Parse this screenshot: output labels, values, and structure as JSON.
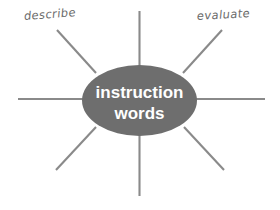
{
  "diagram": {
    "type": "spider-mind-map",
    "background_color": "#ffffff",
    "center": {
      "shape": "ellipse",
      "fill_color": "#6e6e6e",
      "text_color": "#ffffff",
      "line1": "instruction",
      "line2": "words"
    },
    "spoke_color": "#8a8a8a",
    "spoke_count": 8,
    "spokes": [
      {
        "name": "spoke-top",
        "direction": "up",
        "label": ""
      },
      {
        "name": "spoke-top-right",
        "direction": "up-right",
        "label": "evaluate"
      },
      {
        "name": "spoke-right",
        "direction": "right",
        "label": ""
      },
      {
        "name": "spoke-bottom-right",
        "direction": "down-right",
        "label": ""
      },
      {
        "name": "spoke-bottom",
        "direction": "down",
        "label": ""
      },
      {
        "name": "spoke-bottom-left",
        "direction": "down-left",
        "label": ""
      },
      {
        "name": "spoke-left",
        "direction": "left",
        "label": ""
      },
      {
        "name": "spoke-top-left",
        "direction": "up-left",
        "label": "describe"
      }
    ],
    "labels": {
      "top_left": "describe",
      "top_right": "evaluate",
      "label_color": "#6b6b6b"
    }
  }
}
